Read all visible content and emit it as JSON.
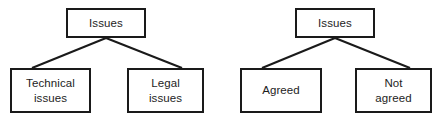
{
  "canvas": {
    "width": 437,
    "height": 122,
    "background": "#ffffff",
    "line_color": "#1a1a1a",
    "text_color": "#1d1d1d"
  },
  "diagrams": [
    {
      "id": "issues-by-type",
      "root": {
        "label": "Issues"
      },
      "children": [
        {
          "label": "Technical\nissues"
        },
        {
          "label": "Legal\nissues"
        }
      ]
    },
    {
      "id": "issues-by-status",
      "root": {
        "label": "Issues"
      },
      "children": [
        {
          "label": "Agreed"
        },
        {
          "label": "Not\nagreed"
        }
      ]
    }
  ],
  "edges": [
    {
      "from": "left-root",
      "to": "technical",
      "x1": 106,
      "y1": 38,
      "x2": 32,
      "y2": 68
    },
    {
      "from": "left-root",
      "to": "legal",
      "x1": 106,
      "y1": 38,
      "x2": 182,
      "y2": 68
    },
    {
      "from": "right-root",
      "to": "agreed",
      "x1": 335,
      "y1": 38,
      "x2": 262,
      "y2": 68
    },
    {
      "from": "right-root",
      "to": "not-agreed",
      "x1": 335,
      "y1": 38,
      "x2": 410,
      "y2": 68
    }
  ]
}
